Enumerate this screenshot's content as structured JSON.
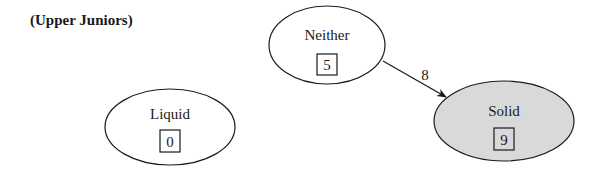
{
  "title": "(Upper Juniors)",
  "nodes": [
    {
      "id": "neither",
      "label": "Neither",
      "count": "5",
      "cx": 327,
      "cy": 45,
      "rx": 58,
      "ry": 39,
      "fill": "#ffffff"
    },
    {
      "id": "solid",
      "label": "Solid",
      "count": "9",
      "cx": 504,
      "cy": 121,
      "rx": 70,
      "ry": 40,
      "fill": "#d9d9d9"
    },
    {
      "id": "liquid",
      "label": "Liquid",
      "count": "0",
      "cx": 170,
      "cy": 127,
      "rx": 65,
      "ry": 38,
      "fill": "#ffffff"
    }
  ],
  "edges": [
    {
      "from": "neither",
      "to": "solid",
      "label": "8"
    }
  ],
  "colors": {
    "stroke": "#1a1a1a",
    "solid_fill": "#d9d9d9",
    "background": "#ffffff"
  }
}
